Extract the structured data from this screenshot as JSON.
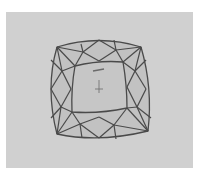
{
  "diagram": {
    "colors": {
      "page": "#ffffff",
      "panel": "#d0d0d0",
      "stone": "#c2c2c2",
      "table": "#c6c6c6",
      "line": "#4a4a4a",
      "mark": "#6a6a6a"
    }
  }
}
